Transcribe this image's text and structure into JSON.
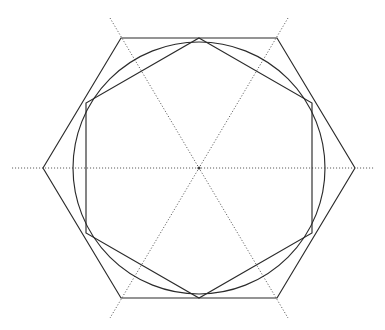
{
  "figure": {
    "canvas": {
      "width": 385,
      "height": 330
    },
    "center": {
      "x": 199,
      "y": 168
    },
    "colors": {
      "background": "#ffffff",
      "solid_line": "#2b2b2b",
      "dotted_line": "#5a5a5a",
      "center_dot": "#3a3a3a"
    },
    "outer_hexagon": {
      "name": "outer-hexagon",
      "orientation": "flat-top",
      "circumradius": 156,
      "points": "43,168 121,38 277,38 355,168 277,298 121,298",
      "vertices": [
        {
          "label": "left",
          "x": 43,
          "y": 168
        },
        {
          "label": "top-left",
          "x": 121,
          "y": 38
        },
        {
          "label": "top-right",
          "x": 277,
          "y": 38
        },
        {
          "label": "right",
          "x": 355,
          "y": 168
        },
        {
          "label": "bottom-right",
          "x": 277,
          "y": 298
        },
        {
          "label": "bottom-left",
          "x": 121,
          "y": 298
        }
      ]
    },
    "inner_hexagon": {
      "name": "inner-hexagon",
      "orientation": "pointy-top",
      "circumradius": 130,
      "rotation_degrees": 30,
      "points": "199,38 312,103 312,233 199,298 86,233 86,103",
      "vertices": [
        {
          "label": "top",
          "x": 199,
          "y": 38
        },
        {
          "label": "upper-right",
          "x": 312,
          "y": 103
        },
        {
          "label": "lower-right",
          "x": 312,
          "y": 233
        },
        {
          "label": "bottom",
          "x": 199,
          "y": 298
        },
        {
          "label": "lower-left",
          "x": 86,
          "y": 233
        },
        {
          "label": "upper-left",
          "x": 86,
          "y": 103
        }
      ]
    },
    "circle": {
      "name": "inscribed-circle",
      "cx": 199,
      "cy": 168,
      "r": 126
    },
    "diameters": [
      {
        "name": "horizontal-diameter",
        "angle_degrees": 0,
        "x1": 12,
        "y1": 168,
        "x2": 374,
        "y2": 168
      },
      {
        "name": "diagonal-diameter-60",
        "angle_degrees": 60,
        "x1": 110,
        "y1": 18,
        "x2": 288,
        "y2": 318
      },
      {
        "name": "diagonal-diameter-120",
        "angle_degrees": 120,
        "x1": 288,
        "y1": 18,
        "x2": 110,
        "y2": 318
      }
    ],
    "center_marker": {
      "name": "center-point",
      "r": 1.6
    }
  }
}
